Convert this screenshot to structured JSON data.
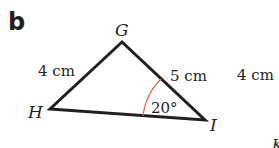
{
  "part_label": "b",
  "triangle": {
    "vertices": [
      {
        "name": "G",
        "x": 122,
        "y": 42
      },
      {
        "name": "H",
        "x": 50,
        "y": 109
      },
      {
        "name": "I",
        "x": 205,
        "y": 120
      }
    ],
    "sides": [
      {
        "between": "GH",
        "label": "4 cm"
      },
      {
        "between": "GI",
        "label": "5 cm"
      }
    ],
    "angle": {
      "at": "I",
      "label": "20°",
      "arc_color": "#e8604c"
    }
  },
  "side_text": "4 cm",
  "side_vertex": "K"
}
